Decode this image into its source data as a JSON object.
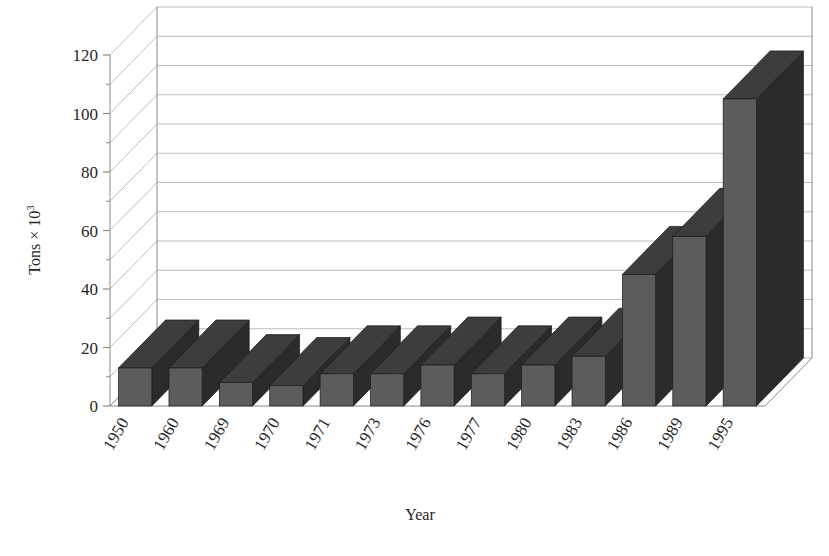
{
  "chart_data": {
    "type": "bar",
    "title": "",
    "subtitle": "",
    "xlabel": "Year",
    "ylabel": "Tons × 10³",
    "ylabel_base": "Tons × 10",
    "ylabel_exponent": "3",
    "categories": [
      "1950",
      "1960",
      "1969",
      "1970",
      "1971",
      "1973",
      "1976",
      "1977",
      "1980",
      "1983",
      "1986",
      "1989",
      "1995"
    ],
    "values": [
      13,
      13,
      8,
      7,
      11,
      11,
      14,
      11,
      14,
      17,
      45,
      58,
      105
    ],
    "ylim": [
      0,
      120
    ],
    "ytick_labels": [
      "0",
      "20",
      "40",
      "60",
      "80",
      "100",
      "120"
    ],
    "ytick_values": [
      0,
      20,
      40,
      60,
      80,
      100,
      120
    ],
    "gridline_interval": 10,
    "grid": true,
    "legend": "none",
    "legend_position": "none",
    "projection": "3d",
    "series": [
      {
        "name": "Tons × 10³",
        "values": [
          13,
          13,
          8,
          7,
          11,
          11,
          14,
          11,
          14,
          17,
          45,
          58,
          105
        ]
      }
    ],
    "colors": {
      "bar_front": "#5c5c5c",
      "bar_side": "#2b2b2b",
      "bar_top": "#3d3d3d",
      "axis": "#8a8a8a",
      "grid": "#b5b5b5",
      "background": "#ffffff",
      "text": "#262626"
    }
  }
}
